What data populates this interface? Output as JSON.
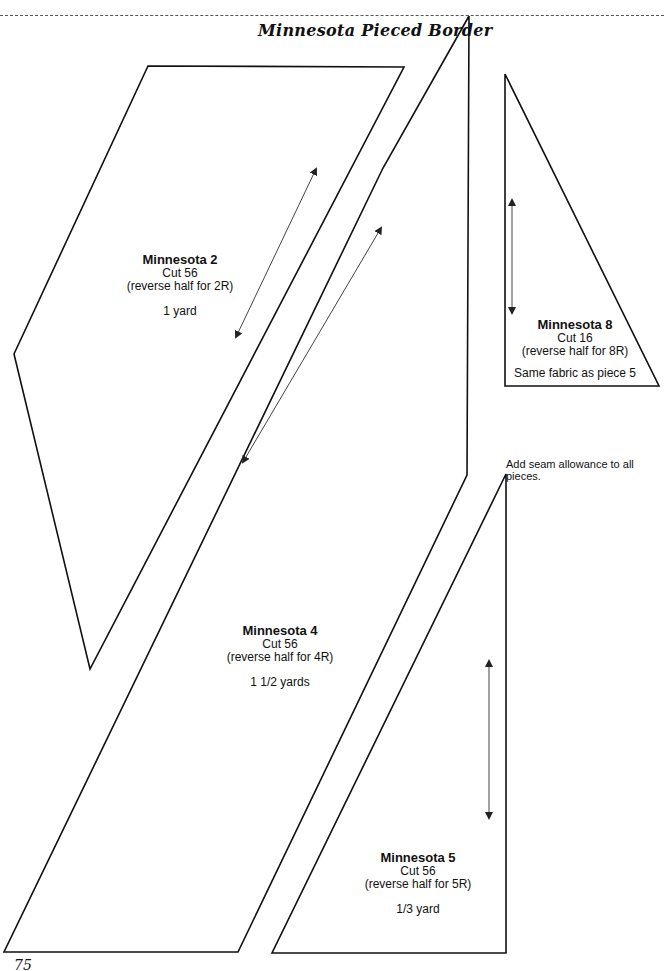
{
  "page": {
    "title": "Minnesota Pieced Border",
    "note": "Add seam allowance to all pieces.",
    "footer": "75"
  },
  "pieces": [
    {
      "name": "Minnesota 2",
      "cut": "Cut 56",
      "reverse": "(reverse half for 2R)",
      "fabric": "1 yard"
    },
    {
      "name": "Minnesota 8",
      "cut": "Cut 16",
      "reverse": "(reverse half for 8R)",
      "fabric": "Same fabric as piece 5"
    },
    {
      "name": "Minnesota 4",
      "cut": "Cut 56",
      "reverse": "(reverse half for 4R)",
      "fabric": "1 1/2 yards"
    },
    {
      "name": "Minnesota 5",
      "cut": "Cut 56",
      "reverse": "(reverse half for 5R)",
      "fabric": "1/3 yard"
    }
  ],
  "colors": {
    "line": "#111111",
    "arrow": "#444444"
  }
}
